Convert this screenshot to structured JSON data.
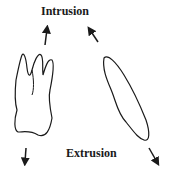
{
  "labels": {
    "top": "Intrusion",
    "bottom": "Extrusion"
  },
  "diagram": {
    "elements": [
      "molar-tooth-outline",
      "incisor-tooth-outline",
      "intrusion-arrows",
      "extrusion-arrows"
    ],
    "stroke_color": "#1a1a1a"
  }
}
